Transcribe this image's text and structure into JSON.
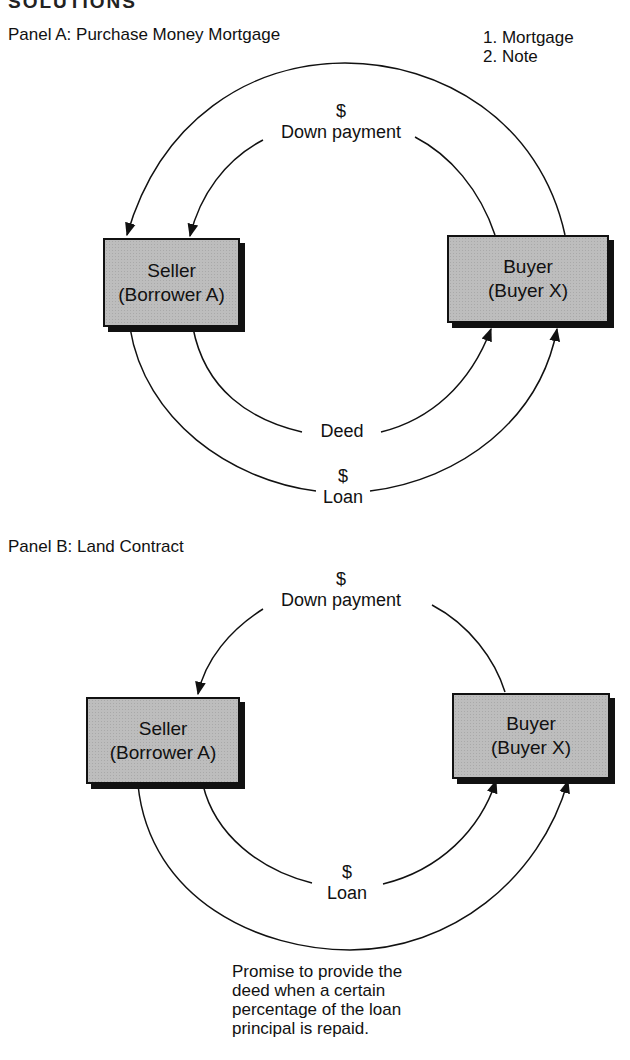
{
  "header_fragment": "SOLUTIONS",
  "panels": [
    {
      "title": "Panel A: Purchase Money Mortgage",
      "seller": {
        "line1": "Seller",
        "line2": "(Borrower A)"
      },
      "buyer": {
        "line1": "Buyer",
        "line2": "(Buyer X)"
      },
      "flows": [
        {
          "from": "buyer",
          "to": "seller",
          "label": [
            "1. Mortgage",
            "2. Note"
          ]
        },
        {
          "from": "buyer",
          "to": "seller",
          "label": [
            "$",
            "Down payment"
          ]
        },
        {
          "from": "seller",
          "to": "buyer",
          "label": [
            "Deed"
          ]
        },
        {
          "from": "seller",
          "to": "buyer",
          "label": [
            "$",
            "Loan"
          ]
        }
      ],
      "labels": {
        "mortgage_note_1": "1. Mortgage",
        "mortgage_note_2": "2. Note",
        "down_payment_symbol": "$",
        "down_payment": "Down payment",
        "deed": "Deed",
        "loan_symbol": "$",
        "loan": "Loan"
      }
    },
    {
      "title": "Panel B: Land Contract",
      "seller": {
        "line1": "Seller",
        "line2": "(Borrower A)"
      },
      "buyer": {
        "line1": "Buyer",
        "line2": "(Buyer X)"
      },
      "flows": [
        {
          "from": "buyer",
          "to": "seller",
          "label": [
            "$",
            "Down payment"
          ]
        },
        {
          "from": "seller",
          "to": "buyer",
          "label": [
            "$",
            "Loan"
          ]
        },
        {
          "from": "seller",
          "to": "buyer",
          "label": [
            "Promise to provide the deed when a certain percentage of the loan principal is repaid."
          ]
        }
      ],
      "labels": {
        "down_payment_symbol": "$",
        "down_payment": "Down payment",
        "loan_symbol": "$",
        "loan": "Loan",
        "promise": [
          "Promise to provide the",
          "deed when a certain",
          "percentage of the loan",
          "principal is repaid."
        ]
      }
    }
  ]
}
